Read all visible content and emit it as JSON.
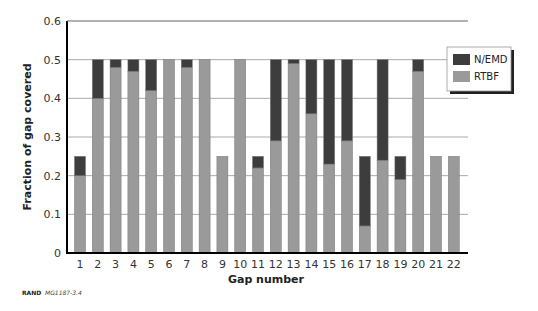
{
  "chart_data": {
    "type": "bar",
    "stacked": true,
    "title": "",
    "xlabel": "Gap number",
    "ylabel": "Fraction of gap covered",
    "ylim": [
      0,
      0.6
    ],
    "yticks": [
      "0",
      "0.1",
      "0.2",
      "0.3",
      "0.4",
      "0.5",
      "0.6"
    ],
    "grid": true,
    "legend_position": "upper right",
    "categories": [
      "1",
      "2",
      "3",
      "4",
      "5",
      "6",
      "7",
      "8",
      "9",
      "10",
      "11",
      "12",
      "13",
      "14",
      "15",
      "16",
      "17",
      "18",
      "19",
      "20",
      "21",
      "22"
    ],
    "series": [
      {
        "name": "RTBF",
        "color": "#9a9a9a",
        "values": [
          0.2,
          0.4,
          0.48,
          0.47,
          0.42,
          0.5,
          0.48,
          0.5,
          0.25,
          0.5,
          0.22,
          0.29,
          0.49,
          0.36,
          0.23,
          0.29,
          0.07,
          0.24,
          0.19,
          0.47,
          0.25,
          0.25
        ]
      },
      {
        "name": "N/EMD",
        "color": "#3d3d3d",
        "values": [
          0.05,
          0.1,
          0.02,
          0.03,
          0.08,
          0.0,
          0.02,
          0.0,
          0.0,
          0.0,
          0.03,
          0.21,
          0.01,
          0.14,
          0.27,
          0.21,
          0.18,
          0.26,
          0.06,
          0.03,
          0.0,
          0.0
        ]
      }
    ]
  },
  "legend": {
    "items": [
      {
        "label": "N/EMD",
        "color": "#3d3d3d"
      },
      {
        "label": "RTBF",
        "color": "#9a9a9a"
      }
    ]
  },
  "credit": {
    "org": "RAND",
    "id": "MG1187-3.4"
  }
}
